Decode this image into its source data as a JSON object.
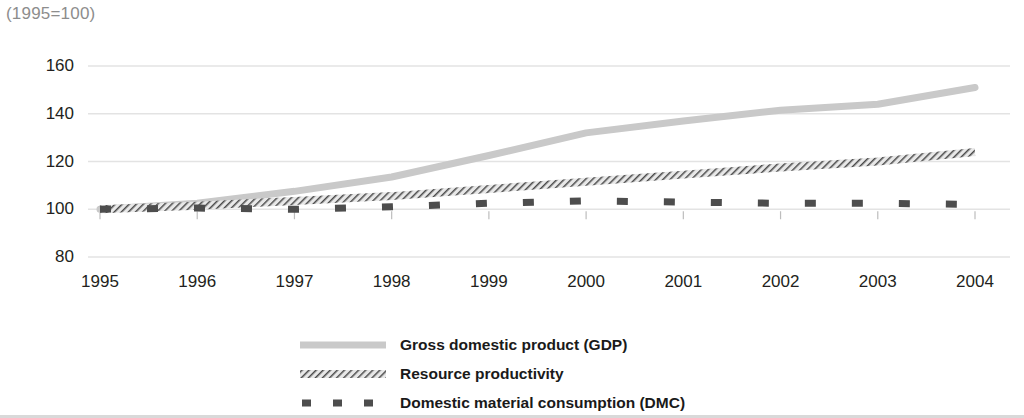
{
  "chart_data": {
    "type": "line",
    "title": "",
    "subtitle": "(1995=100)",
    "xlabel": "",
    "ylabel": "",
    "x": [
      1995,
      1996,
      1997,
      1998,
      1999,
      2000,
      2001,
      2002,
      2003,
      2004
    ],
    "categories": [
      "1995",
      "1996",
      "1997",
      "1998",
      "1999",
      "2000",
      "2001",
      "2002",
      "2003",
      "2004"
    ],
    "xlim": [
      1995,
      2004
    ],
    "ylim": [
      80,
      160
    ],
    "yticks": [
      80,
      100,
      120,
      140,
      160
    ],
    "ytick_labels": [
      "80",
      "100",
      "120",
      "140",
      "160"
    ],
    "grid": "horizontal",
    "legend_position": "bottom-center",
    "series": [
      {
        "name": "Gross domestic product (GDP)",
        "style": "solid",
        "color": "#c9c9c9",
        "values": [
          100,
          102.5,
          107.5,
          113.5,
          122.5,
          132,
          137,
          141.5,
          144,
          151
        ]
      },
      {
        "name": "Resource productivity",
        "style": "hatched",
        "color": "#595959",
        "values": [
          100,
          101.5,
          103.5,
          105.5,
          108.5,
          111.5,
          114.5,
          117.5,
          120,
          124
        ]
      },
      {
        "name": "Domestic material consumption (DMC)",
        "style": "dashed",
        "color": "#4d4d4d",
        "values": [
          100,
          100.5,
          100,
          101,
          102.5,
          103.5,
          103,
          102.5,
          102.5,
          102
        ]
      }
    ]
  },
  "legend": {
    "items": [
      {
        "label": "Gross domestic product (GDP)",
        "swatch": "solid-line-swatch"
      },
      {
        "label": "Resource productivity",
        "swatch": "hatched-line-swatch"
      },
      {
        "label": "Domestic material consumption (DMC)",
        "swatch": "dashed-line-swatch"
      }
    ]
  }
}
